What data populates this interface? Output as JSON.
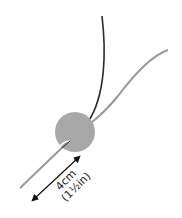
{
  "diagram": {
    "measurement": {
      "metric": "4cm",
      "imperial": "(1½in)"
    },
    "colors": {
      "background": "#ffffff",
      "dark_cord": "#2a2a2a",
      "grey_cord": "#9a9a9a",
      "bead": "#a8a8a8",
      "arrow": "#111111"
    },
    "elements": [
      "dark-cord",
      "grey-cord",
      "bead",
      "dimension-arrow"
    ]
  }
}
